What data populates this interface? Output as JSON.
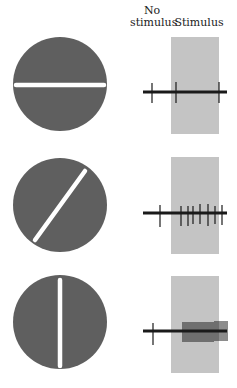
{
  "headers": {
    "no_stimulus_line1": "No",
    "no_stimulus_line2": "stimulus",
    "stimulus": "Stimulus"
  },
  "colors": {
    "disc": "#5f5f5f",
    "bar": "#ffffff",
    "stimulus_band": "#c4c4c4",
    "trace": "#1a1a1a"
  },
  "rows": [
    {
      "orientation": "horizontal",
      "angle_deg": 0,
      "spikes_before": 1,
      "spikes_during": 2
    },
    {
      "orientation": "diagonal",
      "angle_deg": 45,
      "spikes_before": 1,
      "spikes_during": 7
    },
    {
      "orientation": "vertical",
      "angle_deg": 90,
      "spikes_before": 1,
      "spikes_during": 30
    }
  ]
}
